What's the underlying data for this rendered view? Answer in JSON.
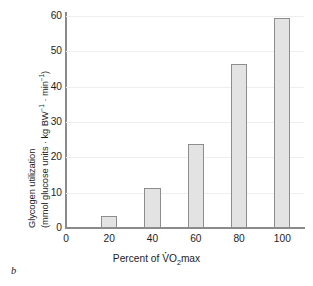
{
  "panel": {
    "label": "b"
  },
  "chart_data": {
    "type": "bar",
    "title": "",
    "categories": [
      "20",
      "40",
      "60",
      "80",
      "100"
    ],
    "values": [
      3.3,
      11.3,
      23.8,
      46.5,
      59.3
    ],
    "series": [
      {
        "name": "Glycogen utilization",
        "values": [
          3.3,
          11.3,
          23.8,
          46.5,
          59.3
        ]
      }
    ],
    "xlabel": "Percent of V̇O2max",
    "ylabel": "Glycogen utilization (mmol glucose units · kg BW⁻¹ · min⁻¹)",
    "ylabel_line1": "Glycogen utilization",
    "ylabel_line2_pre": "(mmol glucose units · kg BW",
    "ylabel_line2_sup1": "−1",
    "ylabel_line2_mid": " · min",
    "ylabel_line2_sup2": "−1",
    "ylabel_line2_post": ")",
    "xlabel_pre": "Percent of ",
    "xlabel_v": "V",
    "xlabel_o": "O",
    "xlabel_sub": "2",
    "xlabel_post": "max",
    "xlim": [
      0,
      110
    ],
    "ylim": [
      0,
      60
    ],
    "yticks": [
      0,
      10,
      20,
      30,
      40,
      50,
      60
    ],
    "ytick_labels": [
      "0",
      "10",
      "20",
      "30",
      "40",
      "50",
      "60"
    ],
    "xticks": [
      0,
      20,
      40,
      60,
      80,
      100
    ],
    "xtick_labels": [
      "0",
      "20",
      "40",
      "60",
      "80",
      "100"
    ],
    "grid": true,
    "legend": null,
    "bar_fill": "#e3e3e3",
    "bar_border": "#8d8d8d",
    "grid_color": "#eceef1",
    "axis_color": "#8a8a8a",
    "bar_width_units": 7.5
  }
}
